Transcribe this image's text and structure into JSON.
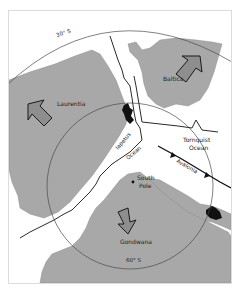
{
  "map": {
    "latitude_lines": [
      {
        "label": "30° S"
      },
      {
        "label": "60° S"
      }
    ],
    "continents": [
      {
        "name": "Laurentia"
      },
      {
        "name": "Baltica"
      },
      {
        "name": "Gondwana"
      },
      {
        "name": "Avalonia"
      }
    ],
    "oceans": [
      {
        "line1": "Iapetus",
        "line2": "Ocean"
      },
      {
        "line1": "Tornquist",
        "line2": "Ocean"
      }
    ],
    "point_labels": [
      {
        "line1": "South",
        "line2": "Pole"
      }
    ],
    "colors": {
      "land": "#a8a8a8",
      "arrow_fill": "#8e8e8e",
      "line": "#2a2a2a",
      "background": "#ffffff"
    }
  }
}
